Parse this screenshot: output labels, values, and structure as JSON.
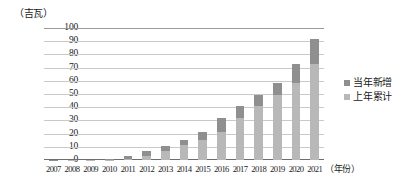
{
  "chart_data": {
    "type": "bar",
    "subtype": "stacked-bar",
    "title": "",
    "xlabel": "（年份）",
    "ylabel": "（吉瓦）",
    "ylim": [
      0,
      100
    ],
    "yticks": [
      0,
      10,
      20,
      30,
      40,
      50,
      60,
      70,
      80,
      90,
      100
    ],
    "grid": true,
    "legend_position": "right",
    "categories": [
      "2007",
      "2008",
      "2009",
      "2010",
      "2011",
      "2012",
      "2013",
      "2014",
      "2015",
      "2016",
      "2017",
      "2018",
      "2019",
      "2020",
      "2021"
    ],
    "series": [
      {
        "name": "上年累计",
        "color": "#b8b8b8",
        "values": [
          0,
          0.1,
          0.15,
          0.3,
          0.8,
          3.3,
          7,
          11,
          15,
          21,
          32,
          41,
          49,
          58,
          73
        ]
      },
      {
        "name": "当年新增",
        "color": "#8f8f8f",
        "values": [
          0.1,
          0.05,
          0.15,
          0.5,
          2.5,
          3.7,
          4,
          4,
          6,
          11,
          9,
          8,
          9,
          15,
          19
        ]
      }
    ],
    "totals": [
      0.1,
      0.15,
      0.3,
      0.8,
      3.3,
      7,
      11,
      15,
      21,
      32,
      41,
      49,
      58,
      73,
      92
    ]
  },
  "axes": {
    "y_unit": "（吉瓦）",
    "x_title": "（年份）",
    "y_tick_labels": [
      "100",
      "90",
      "80",
      "70",
      "60",
      "50",
      "40",
      "30",
      "20",
      "10",
      "0"
    ],
    "x_tick_labels": [
      "2007",
      "2008",
      "2009",
      "2010",
      "2011",
      "2012",
      "2013",
      "2014",
      "2015",
      "2016",
      "2017",
      "2018",
      "2019",
      "2020",
      "2021"
    ]
  },
  "legend": {
    "items": [
      {
        "label": "当年新增",
        "color": "#8f8f8f"
      },
      {
        "label": "上年累计",
        "color": "#b8b8b8"
      }
    ]
  }
}
